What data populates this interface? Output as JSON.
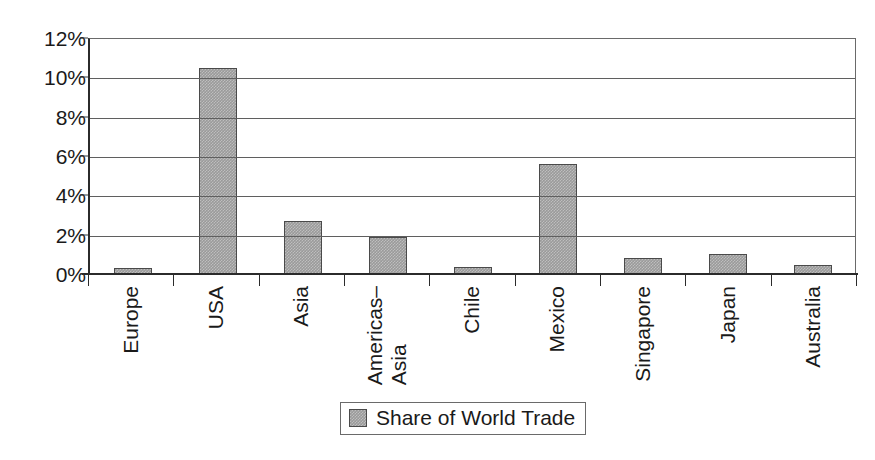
{
  "top_caption_remnant": "",
  "chart_data": {
    "type": "bar",
    "title": "",
    "xlabel": "",
    "ylabel": "",
    "categories": [
      "Europe",
      "USA",
      "Asia",
      "Americas–Asia",
      "Chile",
      "Mexico",
      "Singapore",
      "Japan",
      "Australia"
    ],
    "category_lines": [
      [
        "Europe"
      ],
      [
        "USA"
      ],
      [
        "Asia"
      ],
      [
        "Americas–",
        "Asia"
      ],
      [
        "Chile"
      ],
      [
        "Mexico"
      ],
      [
        "Singapore"
      ],
      [
        "Japan"
      ],
      [
        "Australia"
      ]
    ],
    "values": [
      0.3,
      10.5,
      2.7,
      1.9,
      0.35,
      5.6,
      0.8,
      1.0,
      0.45
    ],
    "value_unit": "%",
    "series": [
      {
        "name": "Share of World Trade",
        "values": [
          0.3,
          10.5,
          2.7,
          1.9,
          0.35,
          5.6,
          0.8,
          1.0,
          0.45
        ]
      }
    ],
    "ylim": [
      0,
      12
    ],
    "yticks": [
      0,
      2,
      4,
      6,
      8,
      10,
      12
    ],
    "ytick_labels": [
      "0%",
      "2%",
      "4%",
      "6%",
      "8%",
      "10%",
      "12%"
    ],
    "grid": true,
    "grid_axis": "y",
    "legend": {
      "position": "bottom-center",
      "entries": [
        {
          "label": "Share of World Trade",
          "swatch": "gray-hatch",
          "color": "#9a9a9a"
        }
      ]
    },
    "colors": {
      "bar_fill": "#9a9a9a",
      "bar_border": "#4a4a4a",
      "gridline": "#5f5f5f",
      "axis": "#2b2b2b",
      "text": "#1a1a1a",
      "background": "#ffffff"
    }
  }
}
